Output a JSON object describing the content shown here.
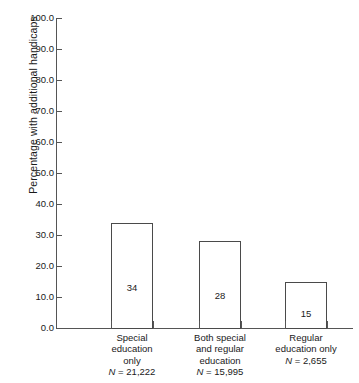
{
  "chart_data": {
    "type": "bar",
    "title": "",
    "xlabel": "",
    "ylabel": "Percentage with additional handicaps",
    "ylim": [
      0,
      100
    ],
    "yticks": [
      "0.0",
      "10.0",
      "20.0",
      "30.0",
      "40.0",
      "50.0",
      "60.0",
      "70.0",
      "80.0",
      "90.0",
      "100.0"
    ],
    "ytick_values": [
      0,
      10,
      20,
      30,
      40,
      50,
      60,
      70,
      80,
      90,
      100
    ],
    "grid": false,
    "legend": "none",
    "categories": [
      "Special\neducation\nonly",
      "Both special\nand regular\neducation",
      "Regular\neducation only"
    ],
    "values": [
      34,
      28,
      15
    ],
    "bar_label_values": [
      "34",
      "28",
      "15"
    ],
    "group_sizes": [
      "N = 21,222",
      "N = 15,995",
      "N = 2,655"
    ],
    "bars": [
      {
        "label_lines": [
          "Special",
          "education",
          "only"
        ],
        "n_label_prefix": "N",
        "n_label_rest": " = 21,222",
        "value": 34,
        "value_text": "34"
      },
      {
        "label_lines": [
          "Both special",
          "and regular",
          "education"
        ],
        "n_label_prefix": "N",
        "n_label_rest": " = 15,995",
        "value": 28,
        "value_text": "28"
      },
      {
        "label_lines": [
          "Regular",
          "education only"
        ],
        "n_label_prefix": "N",
        "n_label_rest": " = 2,655",
        "value": 15,
        "value_text": "15"
      }
    ],
    "colors": {
      "bar_fill": "#ffffff",
      "bar_stroke": "#4a4a4a",
      "axis": "#555555",
      "text": "#1a1a1a",
      "background": "#ffffff"
    }
  }
}
